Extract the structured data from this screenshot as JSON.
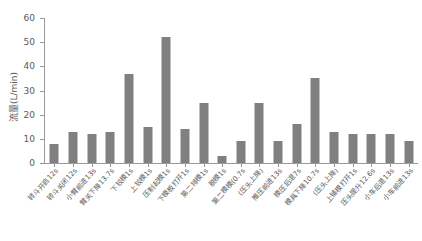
{
  "chart_data": {
    "type": "bar",
    "title": "",
    "xlabel": "",
    "ylabel": "流量(L/min)",
    "ylim": [
      0,
      60
    ],
    "yticks": [
      0,
      10,
      20,
      30,
      40,
      50,
      60
    ],
    "grid": false,
    "legend": false,
    "bar_color": "#808080",
    "axis_color": "#9a9a9a",
    "text_color": "#5a5a5a",
    "categories": [
      "转斗开启12s",
      "转斗关闭12s",
      "小臂前进13s",
      "臂关下降13.7s",
      "下铰模1s",
      "上铰模1s",
      "压制起模1s",
      "下模板打开1s",
      "第二排模1s",
      "脱模1s",
      "第二模模(0.7s",
      "(压头上降)",
      "推压前进13s",
      "模压后退7s",
      "模具下降10.7s",
      "(压头上降)",
      "上铺模打开1s",
      "压头提升12.6s",
      "小车后退13s",
      "小车前进13s"
    ],
    "values": [
      8,
      13,
      12,
      13,
      37,
      15,
      52,
      14,
      25,
      3,
      9,
      25,
      9,
      16,
      35,
      13,
      12,
      12,
      12,
      9
    ]
  }
}
